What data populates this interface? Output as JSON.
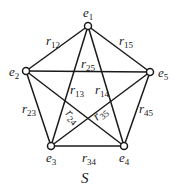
{
  "diagram": {
    "caption": "S",
    "nodes": [
      {
        "id": "e1",
        "label": "e",
        "sub": "1",
        "x": 88,
        "y": 26,
        "lx": 83,
        "ly": 17
      },
      {
        "id": "e2",
        "label": "e",
        "sub": "2",
        "x": 26,
        "y": 71,
        "lx": 9,
        "ly": 76
      },
      {
        "id": "e3",
        "label": "e",
        "sub": "3",
        "x": 51,
        "y": 146,
        "lx": 46,
        "ly": 162
      },
      {
        "id": "e4",
        "label": "e",
        "sub": "4",
        "x": 124,
        "y": 146,
        "lx": 119,
        "ly": 162
      },
      {
        "id": "e5",
        "label": "e",
        "sub": "5",
        "x": 150,
        "y": 72,
        "lx": 158,
        "ly": 77
      }
    ],
    "edges": [
      {
        "id": "r12",
        "from": "e1",
        "to": "e2",
        "label": "r",
        "sub": "12",
        "lx": 46,
        "ly": 45,
        "rot": 0
      },
      {
        "id": "r15",
        "from": "e1",
        "to": "e5",
        "label": "r",
        "sub": "15",
        "lx": 119,
        "ly": 45,
        "rot": 0
      },
      {
        "id": "r25",
        "from": "e2",
        "to": "e5",
        "label": "r",
        "sub": "25",
        "lx": 81,
        "ly": 68,
        "rot": 0
      },
      {
        "id": "r13",
        "from": "e1",
        "to": "e3",
        "label": "r",
        "sub": "13",
        "lx": 70,
        "ly": 94,
        "rot": 0
      },
      {
        "id": "r14",
        "from": "e1",
        "to": "e4",
        "label": "r",
        "sub": "14",
        "lx": 95,
        "ly": 94,
        "rot": 0
      },
      {
        "id": "r23",
        "from": "e2",
        "to": "e3",
        "label": "r",
        "sub": "23",
        "lx": 22,
        "ly": 113,
        "rot": 0
      },
      {
        "id": "r45",
        "from": "e4",
        "to": "e5",
        "label": "r",
        "sub": "45",
        "lx": 139,
        "ly": 113,
        "rot": 0
      },
      {
        "id": "r24",
        "from": "e2",
        "to": "e4",
        "label": "r",
        "sub": "24",
        "lx": 65,
        "ly": 114,
        "rot": 45
      },
      {
        "id": "r35",
        "from": "e3",
        "to": "e5",
        "label": "r",
        "sub": "35",
        "lx": 97,
        "ly": 121,
        "rot": -40
      },
      {
        "id": "r34",
        "from": "e3",
        "to": "e4",
        "label": "r",
        "sub": "34",
        "lx": 82,
        "ly": 162,
        "rot": 0
      }
    ]
  }
}
